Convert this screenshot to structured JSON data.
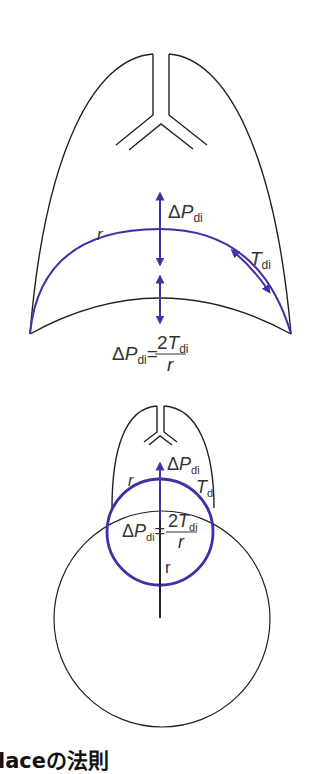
{
  "colors": {
    "outline": "#222222",
    "diaphragm": "#3f32a8",
    "text": "#333333",
    "background": "#ffffff"
  },
  "top_diagram": {
    "label_r": "r",
    "label_delta": "Δ",
    "label_P": "P",
    "label_di": "di",
    "label_T": "T",
    "label_T_sub": "di",
    "formula": {
      "lhs_delta": "Δ",
      "lhs_P": "P",
      "lhs_sub": "di",
      "equals": "=",
      "num_2": "2",
      "num_T": "T",
      "num_sub": "di",
      "den": "r"
    }
  },
  "bottom_diagram": {
    "label_r": "r",
    "label_delta": "Δ",
    "label_P": "P",
    "label_di": "di",
    "label_T": "T",
    "label_T_sub": "d",
    "radius_label": "r",
    "formula": {
      "lhs_delta": "Δ",
      "lhs_P": "P",
      "lhs_sub": "di",
      "equals": "=",
      "num_2": "2",
      "num_T": "T",
      "num_sub": "di",
      "den": "r"
    }
  },
  "caption": "laceの法則"
}
